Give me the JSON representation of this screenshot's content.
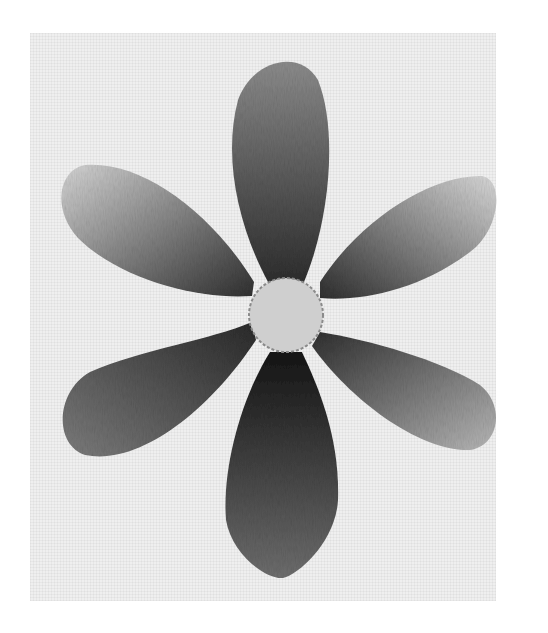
{
  "image": {
    "subject": "Embroidered six-petal flower on linen",
    "style": "grayscale photograph, long-and-short stitch shading",
    "background_color": "#ffffff",
    "fabric_color": "#efefef",
    "fabric_bounds": {
      "x": 30,
      "y": 33,
      "width": 466,
      "height": 568
    }
  },
  "flower": {
    "center": {
      "cx": 286,
      "cy": 315,
      "r": 37,
      "fill": "#cfcfcf",
      "outline": "#8a8a8a"
    },
    "petals": [
      {
        "name": "top",
        "path": "M268,282 C240,230 222,160 238,100 C252,60 300,48 318,80 C338,130 330,220 304,282 Z",
        "base_color": "#2e2e2e",
        "tip_color": "#8c8c8c",
        "gradient": {
          "x1": "50%",
          "y1": "100%",
          "x2": "50%",
          "y2": "0%"
        }
      },
      {
        "name": "upper-left",
        "path": "M252,296 C200,300 120,280 78,238 C52,210 58,170 85,165 C140,160 210,210 254,282 Z",
        "base_color": "#303030",
        "tip_color": "#d6d6d6",
        "gradient": {
          "x1": "100%",
          "y1": "100%",
          "x2": "0%",
          "y2": "0%"
        }
      },
      {
        "name": "upper-right",
        "path": "M320,282 C360,220 430,175 482,176 C505,180 500,230 470,252 C420,290 360,302 320,298 Z",
        "base_color": "#2e2e2e",
        "tip_color": "#dadada",
        "gradient": {
          "x1": "0%",
          "y1": "100%",
          "x2": "100%",
          "y2": "0%"
        }
      },
      {
        "name": "lower-left",
        "path": "M252,322 C210,340 140,350 90,372 C55,392 54,445 85,455 C140,466 210,410 256,340 Z",
        "base_color": "#2a2a2a",
        "tip_color": "#7d7d7d",
        "gradient": {
          "x1": "100%",
          "y1": "0%",
          "x2": "0%",
          "y2": "100%"
        }
      },
      {
        "name": "lower-right",
        "path": "M320,332 C370,340 440,360 480,385 C505,405 500,445 470,450 C420,452 350,400 312,346 Z",
        "base_color": "#2f2f2f",
        "tip_color": "#b9b9b9",
        "gradient": {
          "x1": "0%",
          "y1": "0%",
          "x2": "100%",
          "y2": "100%"
        }
      },
      {
        "name": "bottom",
        "path": "M270,352 C240,400 222,470 226,520 C232,556 268,580 283,578 C300,574 336,540 338,500 C340,440 320,390 302,352 Z",
        "base_color": "#151515",
        "tip_color": "#6e6e6e",
        "gradient": {
          "x1": "50%",
          "y1": "0%",
          "x2": "50%",
          "y2": "100%"
        }
      }
    ]
  }
}
